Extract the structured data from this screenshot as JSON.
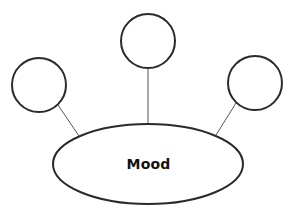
{
  "diagram": {
    "type": "mind-map",
    "central_node": {
      "label": "Mood",
      "shape": "ellipse",
      "cx": 148,
      "cy": 164,
      "rx": 95,
      "ry": 40
    },
    "satellite_nodes": [
      {
        "id": "left",
        "label": "",
        "shape": "circle",
        "cx": 39,
        "cy": 85,
        "r": 27
      },
      {
        "id": "top",
        "label": "",
        "shape": "circle",
        "cx": 148,
        "cy": 41,
        "r": 27
      },
      {
        "id": "right",
        "label": "",
        "shape": "circle",
        "cx": 255,
        "cy": 83,
        "r": 27
      }
    ],
    "connectors": [
      {
        "from": "left",
        "to": "central",
        "x1": 58,
        "y1": 105,
        "x2": 79,
        "y2": 136
      },
      {
        "from": "top",
        "to": "central",
        "x1": 148,
        "y1": 68,
        "x2": 148,
        "y2": 124
      },
      {
        "from": "right",
        "to": "central",
        "x1": 236,
        "y1": 103,
        "x2": 216,
        "y2": 135
      }
    ],
    "colors": {
      "stroke": "#2a2a2a",
      "connector": "#555555",
      "fill": "#ffffff",
      "text": "#111111"
    }
  }
}
